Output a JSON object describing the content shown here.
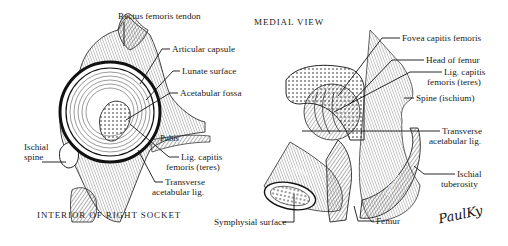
{
  "left_figure": {
    "caption": "INTERIOR OF RIGHT SOCKET",
    "labels": {
      "rectus_femoris_tendon": "Rectus femoris tendon",
      "articular_capsule": "Articular capsule",
      "lunate_surface": "Lunate surface",
      "acetabular_fossa": "Acetabular fossa",
      "pubis": "Pubis",
      "ischial_spine_line1": "Ischial",
      "ischial_spine_line2": "spine",
      "lig_capitis_line1": "Lig. capitis",
      "lig_capitis_line2": "femoris (teres)",
      "transverse_line1": "Transverse",
      "transverse_line2": "acetabular lig."
    }
  },
  "right_figure": {
    "caption": "MEDIAL VIEW",
    "labels": {
      "fovea_capitis_femoris": "Fovea capitis femoris",
      "head_of_femur": "Head of femur",
      "lig_capitis_line1": "Lig. capitis",
      "lig_capitis_line2": "femoris (teres)",
      "spine_ischium": "Spine (ischium)",
      "transverse_line1": "Transverse",
      "transverse_line2": "acetabular lig.",
      "ischial_tuberosity_line1": "Ischial",
      "ischial_tuberosity_line2": "tuberosity",
      "symphysial_surface": "Symphysial surface",
      "femur": "Femur",
      "pubis": "Pubis",
      "ischium": "Ischium"
    }
  },
  "signature": "PaulKy"
}
